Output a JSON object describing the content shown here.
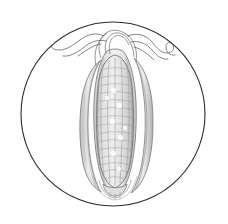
{
  "image": {
    "title": "Ear of maize in circular vignette",
    "subject": "corn-ear",
    "medium": "pencil line drawing with graphite shading",
    "style": "botanical illustration",
    "background_color": "#ffffff",
    "width": 228,
    "height": 224,
    "caption": ""
  },
  "frame": {
    "shape": "circle",
    "center_x": 113,
    "center_y": 114,
    "radius": 92,
    "stroke_color": "#2b2b2b",
    "stroke_width": 1.1,
    "fill": "none"
  },
  "palette": {
    "outline_dark": "#5a5a5a",
    "outline_mid": "#8a8a8a",
    "shading_light": "#b9b9b9",
    "shading_pale": "#d6d6d6",
    "kernel_line": "#9a9a9a",
    "silk_line": "#6e6e6e",
    "paper": "#ffffff"
  },
  "subject_geometry": {
    "ear_center_x": 115,
    "ear_top_y": 34,
    "ear_bottom_y": 196,
    "cob_left_x": 96,
    "cob_right_x": 137,
    "cob_top_y": 56,
    "cob_bottom_y": 186,
    "husk_left_x": 80,
    "husk_right_x": 152
  },
  "parts": [
    {
      "id": "cob",
      "label": "Cob with kernels",
      "description": "Elongated ovoid cob filling the vignette vertically, covered in a grid of kernels"
    },
    {
      "id": "kernel-grid",
      "label": "Kernel rows",
      "column_count": 6,
      "row_count": 17,
      "description": "Vertical column lines crossed by horizontal row lines forming rectangular kernels"
    },
    {
      "id": "husk-left",
      "label": "Left husk leaf",
      "description": "Long tapering husk leaf peeled outward along the left flank of the cob"
    },
    {
      "id": "husk-right",
      "label": "Right husk leaf",
      "description": "Husk leaf hugging the right flank with vertical striations"
    },
    {
      "id": "husk-inner",
      "label": "Inner husk sheath",
      "description": "Narrow inner leaves wrapping the cob just inside the outer husks"
    },
    {
      "id": "silk-left",
      "label": "Left corn silk",
      "description": "Wavy silk strand curling out to the upper left"
    },
    {
      "id": "silk-right",
      "label": "Right corn silk",
      "description": "Wavy silk strand curling out to the upper right and ending in a small hook"
    },
    {
      "id": "tip-bundle",
      "label": "Silk tuft at apex",
      "description": "Bundle of husk tips and silk converging at the top of the ear"
    },
    {
      "id": "base-tip",
      "label": "Tapered base",
      "description": "Rounded tapering base of the ear with overlapping husk ends"
    }
  ]
}
